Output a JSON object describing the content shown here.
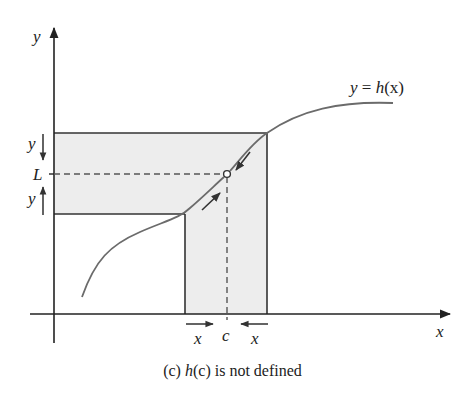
{
  "figure": {
    "axes": {
      "x_label": "x",
      "y_label": "y"
    },
    "curve_label": {
      "lhs": "y",
      "eq": " = ",
      "fn": "h",
      "arg": "(x)"
    },
    "limit_label": "L",
    "point_label": "c",
    "delta_y_upper": "y",
    "delta_y_lower": "y",
    "delta_x_left": "x",
    "delta_x_right": "x",
    "colors": {
      "line": "#333333",
      "curve": "#6b6b6b",
      "band_fill": "#ededed",
      "dash": "#555555"
    }
  },
  "caption": {
    "prefix": "(c) ",
    "fn": "h",
    "arg": "(c)",
    "suffix": " is not defined"
  }
}
